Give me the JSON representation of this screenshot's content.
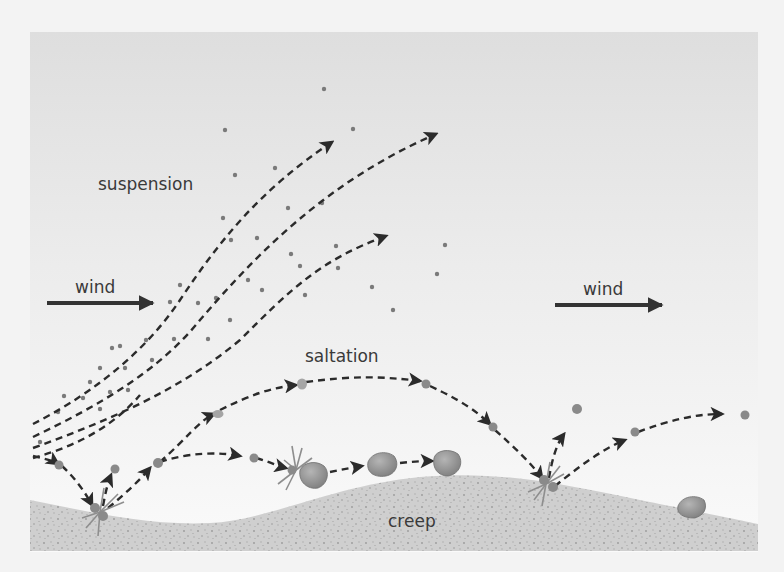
{
  "diagram": {
    "labels": {
      "suspension": "suspension",
      "saltation": "saltation",
      "creep": "creep",
      "wind_left": "wind",
      "wind_right": "wind"
    },
    "icons": {
      "wind_arrow": "right-arrow",
      "trajectory": "dashed-arrow",
      "impact": "impact-burst",
      "grain": "sand-grain",
      "pebble": "pebble"
    },
    "colors": {
      "page": "#f3f3f3",
      "sky_top": "#dedede",
      "sky_bottom": "#fafafa",
      "ground": "#cfcfcf",
      "ground_speckle": "#9a9a9a",
      "path": "#2b2b2b",
      "dust": "#7a7a7a",
      "grain": "#8a8a8a",
      "pebble": "#9d9d9d",
      "text": "#3a3a3a"
    }
  }
}
